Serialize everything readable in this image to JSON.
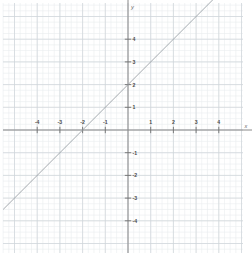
{
  "figure": {
    "title": "",
    "axis_labels": {
      "x": "x",
      "y": "y"
    },
    "colors": {
      "background": "#ffffff",
      "minor_grid": "#e9ecef",
      "major_grid": "#cfd4da",
      "axis": "#888888",
      "line": "#9aa0a6",
      "tick_text": "#4a4a4a",
      "axis_text": "#6a6a6a"
    }
  },
  "chart_data": {
    "type": "line",
    "title": "",
    "xlabel": "x",
    "ylabel": "y",
    "xlim": [
      -5.5,
      5.5
    ],
    "ylim": [
      -5.7,
      5.8
    ],
    "grid": true,
    "minor_grid": true,
    "minor_ticks_per_unit": 4,
    "legend": "none",
    "xticks": [
      -4,
      -3,
      -2,
      -1,
      1,
      2,
      3,
      4
    ],
    "yticks": [
      -4,
      -3,
      -2,
      -1,
      1,
      2,
      3,
      4
    ],
    "xtick_labels": [
      "-4",
      "-3",
      "-2",
      "-1",
      "1",
      "2",
      "3",
      "4"
    ],
    "ytick_labels": [
      "-4",
      "-3",
      "-2",
      "-1",
      "1",
      "2",
      "3",
      "4"
    ],
    "series": [
      {
        "name": "y = x + 2",
        "equation": "y = x + 2",
        "slope": 1,
        "intercept": 2,
        "x_intercept": -2,
        "y_intercept": 2,
        "x": [
          -5.5,
          3.8
        ],
        "values": [
          -3.5,
          5.8
        ],
        "points": [
          [
            -2,
            0
          ],
          [
            0,
            2
          ]
        ]
      }
    ]
  },
  "geometry": {
    "origin_px": {
      "x": 128,
      "y": 130
    },
    "unit_px": 22.7,
    "plot_rect_px": {
      "left": 3,
      "top": 3,
      "right": 243,
      "bottom": 253
    }
  }
}
